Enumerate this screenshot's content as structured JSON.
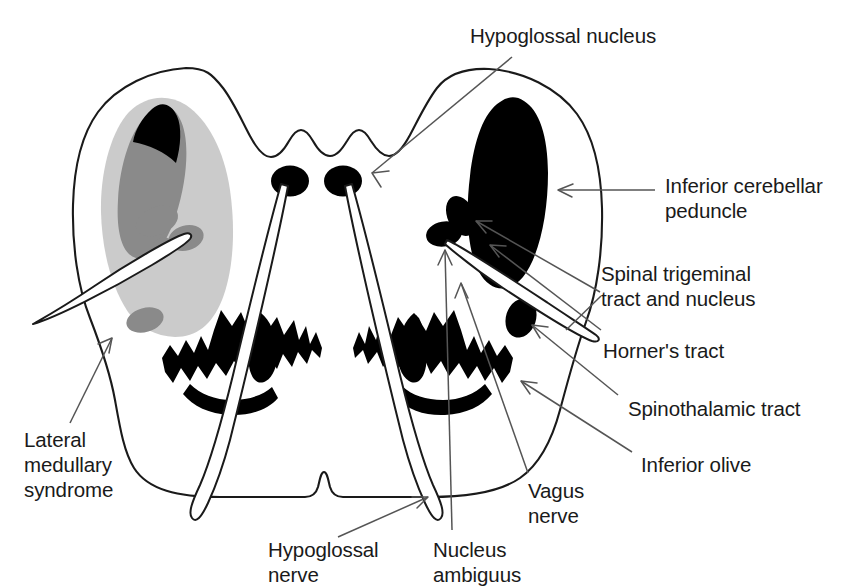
{
  "figure": {
    "background_color": "#ffffff",
    "outline_color": "#1a1a1a",
    "fill_black": "#000000",
    "fill_dark_gray": "#8a8a8a",
    "fill_light_gray": "#cccccc",
    "leader_color": "#555555",
    "text_color": "#1a1a1a"
  },
  "labels": {
    "hypoglossal_nucleus": "Hypoglossal nucleus",
    "inferior_cerebellar_peduncle_line1": "Inferior cerebellar",
    "inferior_cerebellar_peduncle_line2": "peduncle",
    "spinal_trigeminal_line1": "Spinal trigeminal",
    "spinal_trigeminal_line2": "tract and nucleus",
    "horners_tract": "Horner's tract",
    "spinothalamic_tract": "Spinothalamic tract",
    "inferior_olive": "Inferior olive",
    "vagus_nerve_line1": "Vagus",
    "vagus_nerve_line2": "nerve",
    "nucleus_ambiguus_line1": "Nucleus",
    "nucleus_ambiguus_line2": "ambiguus",
    "hypoglossal_nerve_line1": "Hypoglossal",
    "hypoglossal_nerve_line2": "nerve",
    "lateral_medullary_syndrome_line1": "Lateral",
    "lateral_medullary_syndrome_line2": "medullary",
    "lateral_medullary_syndrome_line3": "syndrome"
  },
  "structures": [
    {
      "name": "medulla-outline",
      "fill": "#ffffff",
      "stroke": "#1a1a1a"
    },
    {
      "name": "lateral-medullary-syndrome-region",
      "fill": "#cccccc",
      "side": "left"
    },
    {
      "name": "inferior-cerebellar-peduncle-left",
      "fill": "#8a8a8a",
      "side": "left"
    },
    {
      "name": "inferior-cerebellar-peduncle-right",
      "fill": "#000000",
      "side": "right"
    },
    {
      "name": "spinal-trigeminal-nucleus-left",
      "fill": "#8a8a8a",
      "side": "left"
    },
    {
      "name": "spinal-trigeminal-nucleus-right",
      "fill": "#000000",
      "side": "right"
    },
    {
      "name": "horners-tract-left",
      "fill": "#8a8a8a",
      "side": "left"
    },
    {
      "name": "horners-tract-right",
      "fill": "#000000",
      "side": "right"
    },
    {
      "name": "nucleus-ambiguus-left",
      "fill": "#8a8a8a",
      "side": "left"
    },
    {
      "name": "nucleus-ambiguus-right",
      "fill": "#000000",
      "side": "right"
    },
    {
      "name": "spinothalamic-tract-left",
      "fill": "#8a8a8a",
      "side": "left"
    },
    {
      "name": "spinothalamic-tract-right",
      "fill": "#000000",
      "side": "right"
    },
    {
      "name": "hypoglossal-nucleus-left",
      "fill": "#000000",
      "side": "left"
    },
    {
      "name": "hypoglossal-nucleus-right",
      "fill": "#000000",
      "side": "right"
    },
    {
      "name": "inferior-olive-left",
      "fill": "#000000",
      "side": "left"
    },
    {
      "name": "inferior-olive-right",
      "fill": "#000000",
      "side": "right"
    },
    {
      "name": "hypoglossal-nerve-left",
      "fill": "#ffffff",
      "side": "left"
    },
    {
      "name": "hypoglossal-nerve-right",
      "fill": "#ffffff",
      "side": "right"
    },
    {
      "name": "spinal-trigeminal-tract-left",
      "fill": "#ffffff",
      "side": "left"
    },
    {
      "name": "spinal-trigeminal-tract-right",
      "fill": "#ffffff",
      "side": "right"
    }
  ]
}
